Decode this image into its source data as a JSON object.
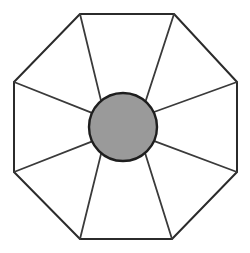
{
  "figure": {
    "type": "geometric-diagram",
    "canvas": {
      "width": 250,
      "height": 253,
      "background": "#ffffff"
    },
    "colors": {
      "background": "#ffffff",
      "outline": "#2b2b2b",
      "spoke": "#3a3a3a",
      "hub_fill": "#9a9a9a",
      "hub_stroke": "#1e1e1e",
      "sector_fill": "#ffffff"
    },
    "stroke_widths": {
      "octagon_outline": 2.0,
      "spoke": 1.8,
      "hub_outline": 2.4
    },
    "octagon": {
      "name": "outer-octagon",
      "sides": 8,
      "vertex_count": 8,
      "vertices": [
        {
          "label": "top-left",
          "x": 80,
          "y": 14
        },
        {
          "label": "top-right",
          "x": 174,
          "y": 14
        },
        {
          "label": "right-top",
          "x": 237,
          "y": 82
        },
        {
          "label": "right-bottom",
          "x": 237,
          "y": 172
        },
        {
          "label": "bottom-right",
          "x": 172,
          "y": 239
        },
        {
          "label": "bottom-left",
          "x": 80,
          "y": 239
        },
        {
          "label": "left-bottom",
          "x": 14,
          "y": 172
        },
        {
          "label": "left-top",
          "x": 14,
          "y": 82
        }
      ],
      "points_attr": "80,14 174,14 237,82 237,172 172,239 80,239 14,172 14,82"
    },
    "hub_circle": {
      "name": "center-circle",
      "center_x": 123,
      "center_y": 127,
      "radius": 34,
      "fill": "#9a9a9a",
      "stroke": "#1e1e1e"
    },
    "spokes": {
      "count": 8,
      "description": "Each spoke runs from the central circle edge outward to one octagon vertex",
      "lines": [
        {
          "name": "spoke-to-top-left",
          "x1": 100.9,
          "y1": 100.1,
          "x2": 80,
          "y2": 14
        },
        {
          "name": "spoke-to-top-right",
          "x1": 145.6,
          "y1": 101.3,
          "x2": 174,
          "y2": 14
        },
        {
          "name": "spoke-to-right-top",
          "x1": 154.0,
          "y1": 112.0,
          "x2": 237,
          "y2": 82
        },
        {
          "name": "spoke-to-right-bottom",
          "x1": 154.4,
          "y1": 141.1,
          "x2": 237,
          "y2": 172
        },
        {
          "name": "spoke-to-bottom-right",
          "x1": 145.0,
          "y1": 152.8,
          "x2": 172,
          "y2": 239
        },
        {
          "name": "spoke-to-bottom-left",
          "x1": 101.3,
          "y1": 152.9,
          "x2": 80,
          "y2": 239
        },
        {
          "name": "spoke-to-left-bottom",
          "x1": 91.6,
          "y1": 141.6,
          "x2": 14,
          "y2": 172
        },
        {
          "name": "spoke-to-left-top",
          "x1": 91.3,
          "y1": 112.7,
          "x2": 14,
          "y2": 82
        }
      ]
    },
    "sectors": {
      "count": 8,
      "description": "Eight white triangular sectors between adjacent spokes and octagon edges",
      "faces": [
        {
          "name": "sector-top",
          "points_attr": "80,14 174,14 145.6,101.3 100.9,100.1"
        },
        {
          "name": "sector-top-right",
          "points_attr": "174,14 237,82 154.0,112.0 145.6,101.3"
        },
        {
          "name": "sector-right",
          "points_attr": "237,82 237,172 154.4,141.1 154.0,112.0"
        },
        {
          "name": "sector-bottom-right",
          "points_attr": "237,172 172,239 145.0,152.8 154.4,141.1"
        },
        {
          "name": "sector-bottom",
          "points_attr": "172,239 80,239 101.3,152.9 145.0,152.8"
        },
        {
          "name": "sector-bottom-left",
          "points_attr": "80,239 14,172 91.6,141.6 101.3,152.9"
        },
        {
          "name": "sector-left",
          "points_attr": "14,172 14,82 91.3,112.7 91.6,141.6"
        },
        {
          "name": "sector-top-left",
          "points_attr": "14,82 80,14 100.9,100.1 91.3,112.7"
        }
      ]
    }
  }
}
